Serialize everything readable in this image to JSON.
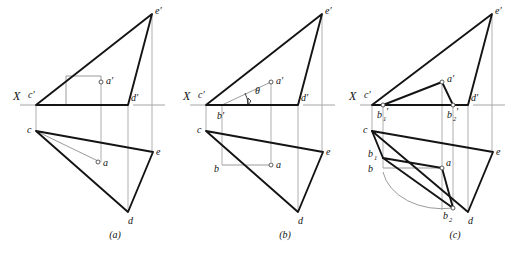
{
  "sheet": {
    "title": "Descriptive geometry three-step construction",
    "background_color": "#ffffff",
    "line_color": "#141414",
    "thin_line_color": "#8f8f8f"
  },
  "panels": [
    {
      "id": "a",
      "caption": "(a)",
      "axis_label": "X",
      "labels": {
        "c_prime": "c′",
        "d_prime": "d′",
        "e_prime": "e′",
        "a_prime": "a′",
        "c": "c",
        "d": "d",
        "e": "e",
        "a": "a"
      }
    },
    {
      "id": "b",
      "caption": "(b)",
      "axis_label": "X",
      "labels": {
        "c_prime": "c′",
        "d_prime": "d′",
        "e_prime": "e′",
        "a_prime": "a′",
        "b_prime": "b′",
        "c": "c",
        "d": "d",
        "e": "e",
        "a": "a",
        "b": "b",
        "theta": "θ"
      }
    },
    {
      "id": "c",
      "caption": "(c)",
      "axis_label": "X",
      "labels": {
        "c_prime": "c′",
        "d_prime": "d′",
        "e_prime": "e′",
        "a_prime": "a′",
        "b1_prime_base": "b",
        "b1_prime_sub": "1",
        "b1_prime_mark": "′",
        "b2_prime_base": "b",
        "b2_prime_sub": "2",
        "b2_prime_mark": "′",
        "c": "c",
        "d": "d",
        "e": "e",
        "a": "a",
        "b": "b",
        "b1_base": "b",
        "b1_sub": "1",
        "b2_base": "b",
        "b2_sub": "2"
      }
    }
  ]
}
